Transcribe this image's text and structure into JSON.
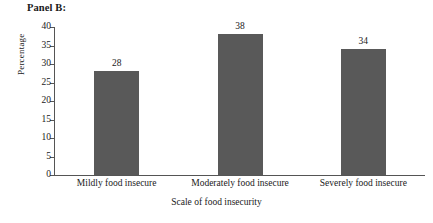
{
  "panel": {
    "title": "Panel B:"
  },
  "chart_data": {
    "type": "bar",
    "title": "Panel B:",
    "categories": [
      "Mildly food insecure",
      "Moderately food insecure",
      "Severely food insecure"
    ],
    "values": [
      28,
      38,
      34
    ],
    "xlabel": "Scale of food insecurity",
    "ylabel": "Percentage",
    "ylim": [
      0,
      40
    ],
    "yticks": [
      0,
      5,
      10,
      15,
      20,
      25,
      30,
      35,
      40
    ],
    "ytick_labels": [
      "0",
      "5",
      "10",
      "15",
      "20",
      "25",
      "30",
      "35",
      "40"
    ],
    "data_labels": [
      "28",
      "38",
      "34"
    ],
    "grid": false,
    "legend": false,
    "bar_color": "#595959",
    "axis_color": "#555555",
    "background": "#ffffff"
  }
}
